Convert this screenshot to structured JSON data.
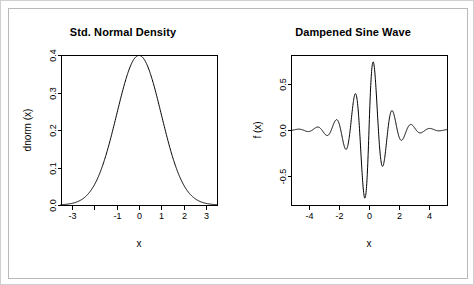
{
  "figure": {
    "background_color": "#ffffff",
    "foreground_color": "#000000",
    "border_color": "#cfcfcf",
    "inner_frame_color": "#b9b9b9",
    "panel_layout": "1 row x 2 columns"
  },
  "chart_data": [
    {
      "type": "line",
      "id": "std-normal-density",
      "title": "Std. Normal Density",
      "xlabel": "x",
      "ylabel": "dnorm (x)",
      "xlim": [
        -3.5,
        3.5
      ],
      "ylim": [
        0.0,
        0.4
      ],
      "grid": false,
      "legend": null,
      "x_ticks": [
        -3,
        -2,
        -1,
        0,
        1,
        2,
        3
      ],
      "x_tick_labels": [
        "-3",
        "",
        "-1",
        "0",
        "1",
        "2",
        "3"
      ],
      "y_ticks": [
        0.0,
        0.1,
        0.2,
        0.3,
        0.4
      ],
      "y_tick_labels": [
        "0.0",
        "0.1",
        "0.2",
        "0.3",
        "0.4"
      ],
      "function": "gaussian",
      "params": {
        "mu": 0,
        "sigma": 1,
        "amplitude": 0.3989
      },
      "x": [
        -3.5,
        -3.25,
        -3,
        -2.75,
        -2.5,
        -2.25,
        -2,
        -1.75,
        -1.5,
        -1.25,
        -1,
        -0.75,
        -0.5,
        -0.25,
        0,
        0.25,
        0.5,
        0.75,
        1,
        1.25,
        1.5,
        1.75,
        2,
        2.25,
        2.5,
        2.75,
        3,
        3.25,
        3.5
      ],
      "values": [
        0.0009,
        0.002,
        0.0044,
        0.0091,
        0.0175,
        0.0317,
        0.054,
        0.0863,
        0.1295,
        0.1826,
        0.242,
        0.3011,
        0.3521,
        0.3867,
        0.3989,
        0.3867,
        0.3521,
        0.3011,
        0.242,
        0.1826,
        0.1295,
        0.0863,
        0.054,
        0.0317,
        0.0175,
        0.0091,
        0.0044,
        0.002,
        0.0009
      ]
    },
    {
      "type": "line",
      "id": "dampened-sine-wave",
      "title": "Dampened Sine Wave",
      "xlabel": "x",
      "ylabel": "f (x)",
      "xlim": [
        -5.2,
        5.2
      ],
      "ylim": [
        -0.82,
        0.82
      ],
      "grid": false,
      "legend": null,
      "x_ticks": [
        -4,
        -2,
        0,
        2,
        4
      ],
      "x_tick_labels": [
        "-4",
        "-2",
        "0",
        "2",
        "4"
      ],
      "y_ticks": [
        -0.5,
        0.0,
        0.5
      ],
      "y_tick_labels": [
        "-0.5",
        "0.0",
        "0.5"
      ],
      "function": "damped_sine",
      "params": {
        "frequency": 5,
        "decay": 1,
        "amplitude": 1
      },
      "description": "sin(5x) / exp(|x|) style dampened oscillation, peak 0.78 near x=0.2, trough -0.78 near x=-0.3"
    }
  ],
  "panels": {
    "left": {
      "title": "Std. Normal Density",
      "xlabel": "x",
      "ylabel": "dnorm (x)"
    },
    "right": {
      "title": "Dampened Sine Wave",
      "xlabel": "x",
      "ylabel": "f (x)"
    }
  }
}
